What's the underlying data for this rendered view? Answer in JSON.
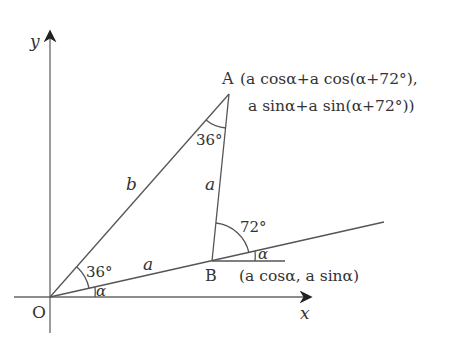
{
  "diagram": {
    "axes": {
      "x_label": "x",
      "y_label": "y",
      "origin_label": "O"
    },
    "points": {
      "A": {
        "label": "A",
        "coord_line1": "(a cosα+a cos(α+72°),",
        "coord_line2": "a sinα+a sin(α+72°))"
      },
      "B": {
        "label": "B",
        "coord": "(a cosα, a sinα)"
      }
    },
    "segments": {
      "OA": "b",
      "OB": "a",
      "AB": "a"
    },
    "angles": {
      "AOB": "36°",
      "xOB": "α",
      "OAB": "36°",
      "exterior_B": "72°",
      "horizontal_B": "α"
    },
    "colors": {
      "line": "#555555",
      "text": "#333333"
    }
  }
}
